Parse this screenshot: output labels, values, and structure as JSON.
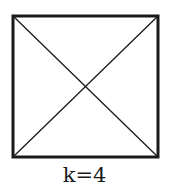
{
  "diagram": {
    "type": "square-with-diagonals",
    "label": "k=4",
    "square": {
      "x1": 13,
      "y1": 16,
      "x2": 158,
      "y2": 157
    },
    "stroke_color": "#1a1a1a",
    "border_width": 3,
    "diagonal_width": 1.3
  }
}
